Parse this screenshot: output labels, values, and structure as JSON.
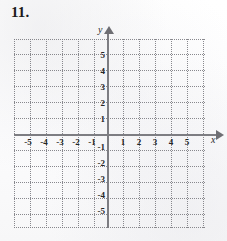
{
  "problem": {
    "number_label": "11."
  },
  "graph": {
    "type": "cartesian-grid",
    "description": "Blank Cartesian coordinate plane",
    "axis_labels": {
      "x": "x",
      "y": "y"
    },
    "x_ticks": [
      {
        "label": "-5",
        "value": -5
      },
      {
        "label": "-4",
        "value": -4
      },
      {
        "label": "-3",
        "value": -3
      },
      {
        "label": "-2",
        "value": -2
      },
      {
        "label": "-1",
        "value": -1
      },
      {
        "label": "1",
        "value": 1
      },
      {
        "label": "2",
        "value": 2
      },
      {
        "label": "3",
        "value": 3
      },
      {
        "label": "4",
        "value": 4
      },
      {
        "label": "5",
        "value": 5
      }
    ],
    "y_ticks": [
      {
        "label": "5",
        "value": 5
      },
      {
        "label": "4",
        "value": 4
      },
      {
        "label": "3",
        "value": 3
      },
      {
        "label": "2",
        "value": 2
      },
      {
        "label": "1",
        "value": 1
      },
      {
        "label": "-1",
        "value": -1
      },
      {
        "label": "-2",
        "value": -2
      },
      {
        "label": "-3",
        "value": -3
      },
      {
        "label": "-4",
        "value": -4
      },
      {
        "label": "-5",
        "value": -5
      }
    ],
    "colors": {
      "axis": "#7d7d82",
      "grid": "#8c8c91",
      "text": "#262626",
      "background": "#fdfdfd"
    }
  }
}
